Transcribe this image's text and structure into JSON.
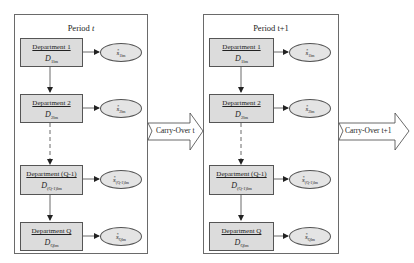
{
  "diagram": {
    "periods": [
      {
        "title_prefix": "Period ",
        "title_var": "t",
        "departments": [
          {
            "name": "Department 1",
            "symbol": "D",
            "sub": "1lm",
            "output": "s",
            "output_sub": "1lm",
            "output_sup": "*"
          },
          {
            "name": "Department 2",
            "symbol": "D",
            "sub": "2lm",
            "output": "s",
            "output_sub": "2lm",
            "output_sup": "*"
          },
          {
            "name": "Department (Q-1)",
            "symbol": "D",
            "sub": "(Q-1)lm",
            "output": "s",
            "output_sub": "(Q-1)lm",
            "output_sup": "*"
          },
          {
            "name": "Department Q",
            "symbol": "D",
            "sub": "Qlm",
            "output": "s",
            "output_sub": "Qlm",
            "output_sup": "*"
          }
        ],
        "carry_over": "Carry-Over t"
      },
      {
        "title_prefix": "Period t+1",
        "title_var": "",
        "departments": [
          {
            "name": "Department 1",
            "symbol": "D",
            "sub": "1lm",
            "output": "s",
            "output_sub": "1lm",
            "output_sup": "*"
          },
          {
            "name": "Department 2",
            "symbol": "D",
            "sub": "2lm",
            "output": "s",
            "output_sub": "2lm",
            "output_sup": "*"
          },
          {
            "name": "Department (Q-1)",
            "symbol": "D",
            "sub": "(Q-1)lm",
            "output": "s",
            "output_sub": "(Q-1)lm",
            "output_sup": "*"
          },
          {
            "name": "Department Q",
            "symbol": "D",
            "sub": "Qlm",
            "output": "s",
            "output_sub": "Qlm",
            "output_sup": "*"
          }
        ],
        "carry_over": "Carry-Over t+1"
      }
    ],
    "colors": {
      "box_fill": "#dcdcdc",
      "ellipse_fill": "#e4e4e4",
      "border": "#555555",
      "period_border": "#6a6a6a"
    }
  }
}
